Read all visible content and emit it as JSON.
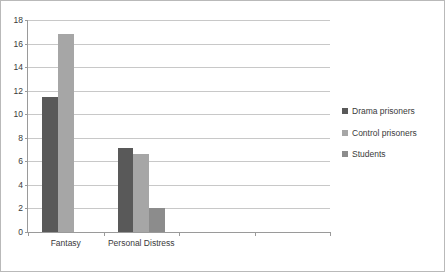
{
  "chart_data": {
    "type": "bar",
    "title": "",
    "subtitle": "",
    "xlabel": "",
    "ylabel": "",
    "categories": [
      "Fantasy",
      "Personal Distress",
      "",
      ""
    ],
    "series": [
      {
        "name": "Drama prisoners",
        "color": "#595959",
        "values": [
          11.5,
          7.1,
          null,
          null
        ]
      },
      {
        "name": "Control prisoners",
        "color": "#a6a6a6",
        "values": [
          16.8,
          6.6,
          null,
          null
        ]
      },
      {
        "name": "Students",
        "color": "#8c8c8c",
        "values": [
          null,
          2.0,
          null,
          null
        ]
      }
    ],
    "ylim": [
      0,
      18
    ],
    "ytick_step": 2,
    "yticks": [
      0,
      2,
      4,
      6,
      8,
      10,
      12,
      14,
      16,
      18
    ],
    "ytick_labels": [
      "0",
      "2",
      "4",
      "6",
      "8",
      "10",
      "12",
      "14",
      "16",
      "18"
    ],
    "grid": true,
    "grid_axis": "y",
    "legend_position": "right",
    "legend_entries": [
      "Drama prisoners",
      "Control prisoners",
      "Students"
    ],
    "plot_background": "#ffffff",
    "gridline_color": "#c8c8c8",
    "axis_color": "#9a9a9a",
    "text_color": "#3a3a3a",
    "border_color": "#b9b9b9"
  }
}
